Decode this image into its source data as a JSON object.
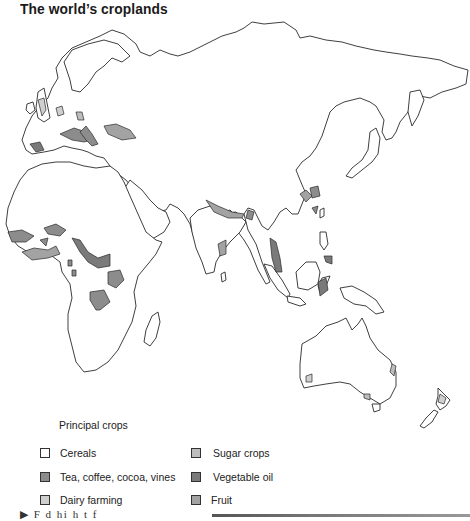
{
  "title": "The world’s croplands",
  "legend": {
    "heading": "Principal crops",
    "items": [
      {
        "label": "Cereals",
        "color": "#ffffff"
      },
      {
        "label": "Tea, coffee, cocoa, vines",
        "color": "#8c8c8c"
      },
      {
        "label": "Dairy farming",
        "color": "#cfcfcf"
      },
      {
        "label": "Sugar crops",
        "color": "#bdbdbd"
      },
      {
        "label": "Vegetable oil",
        "color": "#7a7a7a"
      },
      {
        "label": "Fruit",
        "color": "#a3a3a3"
      }
    ]
  },
  "footer": {
    "partial_text": "▶ F   d  hi  h           t  f"
  },
  "map": {
    "regions": [
      "Europe",
      "Africa",
      "Middle East",
      "South Asia",
      "East Asia",
      "Southeast Asia",
      "Australia",
      "New Zealand"
    ]
  }
}
